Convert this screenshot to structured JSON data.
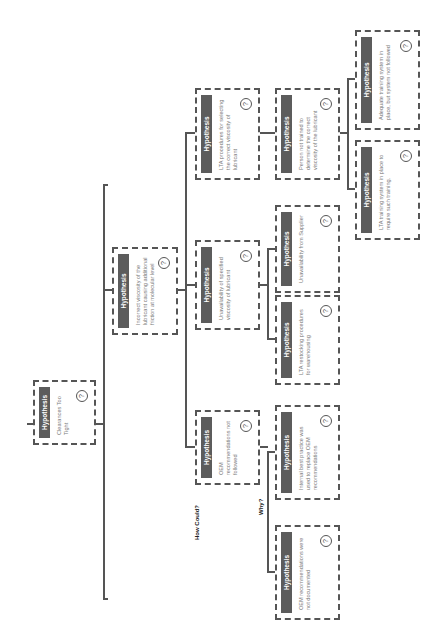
{
  "diagram": {
    "type": "hypothesis-tree",
    "orientation": "rotated-90-ccw",
    "header_color": "#5c5c5c",
    "border_color": "#555555",
    "labels": {
      "how_could": "How Could?",
      "why": "Why?"
    },
    "help_glyph": "?",
    "nodes": {
      "root": {
        "header": "Hypothesis",
        "text": "Clearances Too Tight"
      },
      "oem_not_followed": {
        "header": "Hypothesis",
        "text": "OEM recommendations not followed"
      },
      "incorrect_viscosity": {
        "header": "Hypothesis",
        "text": "Incorrect viscosity of the lubricant causing additional friction at molecular level"
      },
      "unavailability_specified": {
        "header": "Hypothesis",
        "text": "Unavailability of specified viscosity of lubricant"
      },
      "lta_procedures": {
        "header": "Hypothesis",
        "text": "LTA procedures for selecting the correct viscosity of lubricant"
      },
      "oem_not_documented": {
        "header": "Hypothesis",
        "text": "OEM recommendations were not documented"
      },
      "internal_best_practice": {
        "header": "Hypothesis",
        "text": "Internal best practice was used to replace OEM recommendations"
      },
      "lta_restocking": {
        "header": "Hypothesis",
        "text": "LTA restocking procedures for warehousing"
      },
      "unavailability_supplier": {
        "header": "Hypothesis",
        "text": "Unavailability from Supplier"
      },
      "person_not_trained": {
        "header": "Hypothesis",
        "text": "Person not trained to determine the correct viscosity of the lubricant"
      },
      "lta_training_system": {
        "header": "Hypothesis",
        "text": "LTA training system in place to require such training."
      },
      "adequate_training": {
        "header": "Hypothesis",
        "text": "Adequate training system in place, but system not followed"
      }
    }
  }
}
